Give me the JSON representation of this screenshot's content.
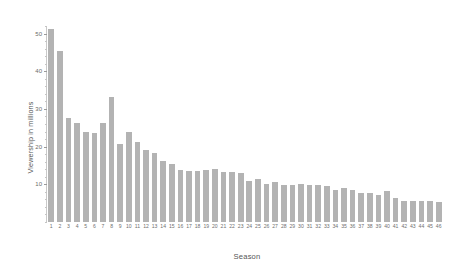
{
  "chart_data": {
    "type": "bar",
    "title": "",
    "xlabel": "Season",
    "ylabel": "Viewership in millions",
    "categories": [
      "1",
      "2",
      "3",
      "4",
      "5",
      "6",
      "7",
      "8",
      "9",
      "10",
      "11",
      "12",
      "13",
      "14",
      "15",
      "16",
      "17",
      "18",
      "19",
      "20",
      "21",
      "22",
      "23",
      "24",
      "25",
      "26",
      "27",
      "28",
      "29",
      "30",
      "31",
      "32",
      "33",
      "34",
      "35",
      "36",
      "37",
      "38",
      "39",
      "40",
      "41",
      "42",
      "43",
      "44",
      "45",
      "46"
    ],
    "values": [
      51.1,
      45.5,
      27.5,
      26.3,
      23.9,
      23.5,
      26.2,
      33.1,
      20.6,
      23.8,
      21.1,
      19.2,
      18.2,
      16.3,
      15.3,
      13.8,
      13.6,
      13.6,
      13.8,
      14.0,
      13.4,
      13.3,
      12.9,
      10.8,
      11.4,
      10.1,
      10.5,
      9.9,
      9.9,
      10.1,
      9.9,
      9.7,
      9.5,
      8.6,
      8.9,
      8.4,
      7.8,
      7.8,
      7.2,
      8.2,
      6.5,
      5.7,
      5.7,
      5.7,
      5.7,
      5.2
    ],
    "ylim": [
      0,
      52
    ],
    "xlim_note": "categorical, 46 bars",
    "yticks_major": [
      10,
      20,
      30,
      40,
      50
    ],
    "ytick_labels": [
      "10",
      "20",
      "30",
      "40",
      "50"
    ],
    "ytick_minor_step": 2,
    "grid": false,
    "legend": null,
    "bar_color": "#b3b3b3",
    "axis_color": "#c9c9c9",
    "background_color": "#ffffff",
    "text_color": "#6b6b6b"
  }
}
